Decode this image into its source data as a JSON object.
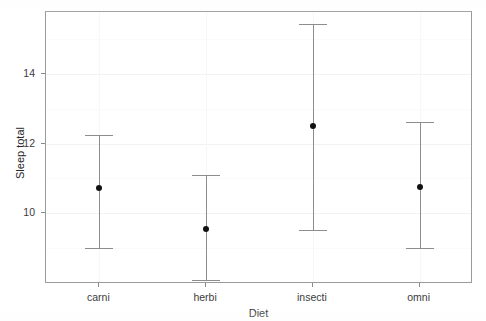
{
  "chart_data": {
    "type": "scatter",
    "title": "",
    "subtitle": "",
    "xlabel": "Diet",
    "ylabel": "Sleep total",
    "categories": [
      "carni",
      "herbi",
      "insecti",
      "omni"
    ],
    "values": [
      10.74,
      9.59,
      12.53,
      10.79
    ],
    "error_low": [
      9.03,
      8.12,
      9.56,
      9.03
    ],
    "error_high": [
      12.26,
      11.13,
      15.47,
      12.65
    ],
    "ytick_labels": [
      "10",
      "12",
      "14"
    ],
    "ytick_values": [
      10,
      12,
      14
    ],
    "ylim": [
      8.0,
      15.8
    ],
    "xlim_categories": 4,
    "grid": true,
    "legend": "none",
    "series": [
      {
        "name": "mean sleep total with confidence interval",
        "points": [
          {
            "category": "carni",
            "mean": 10.74,
            "lower": 9.03,
            "upper": 12.26
          },
          {
            "category": "herbi",
            "mean": 9.59,
            "lower": 8.12,
            "upper": 11.13
          },
          {
            "category": "insecti",
            "mean": 12.53,
            "lower": 9.56,
            "upper": 15.47
          },
          {
            "category": "omni",
            "mean": 10.79,
            "lower": 9.03,
            "upper": 12.65
          }
        ]
      }
    ],
    "colors": {
      "point": "#111111",
      "errorbar": "#8d8d8d",
      "panel_border": "#9a9a9a",
      "gridline": "#f2f2f2",
      "text": "#333333",
      "background": "#ffffff"
    }
  }
}
